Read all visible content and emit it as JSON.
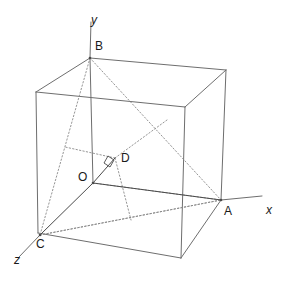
{
  "figure": {
    "width": 287,
    "height": 281,
    "background": "#ffffff",
    "stroke_solid": "#6e6e6e",
    "stroke_dotted": "#8a8a8a",
    "stroke_accent": "#4a4a4a",
    "label_color": "#1a1a1a"
  },
  "axes": [
    {
      "id": "x",
      "label": "x",
      "label_x": 266,
      "label_y": 204,
      "from": [
        221,
        200
      ],
      "to": [
        262,
        196
      ]
    },
    {
      "id": "y",
      "label": "y",
      "label_x": 91,
      "label_y": 14,
      "from": [
        90,
        58
      ],
      "to": [
        91,
        22
      ]
    },
    {
      "id": "z",
      "label": "z",
      "label_x": 14,
      "label_y": 254,
      "from": [
        40,
        235
      ],
      "to": [
        19,
        257
      ]
    }
  ],
  "points": [
    {
      "id": "A",
      "label": "A",
      "x": 221,
      "y": 200,
      "label_x": 224,
      "label_y": 205
    },
    {
      "id": "B",
      "label": "B",
      "x": 90,
      "y": 58,
      "label_x": 95,
      "label_y": 40
    },
    {
      "id": "C",
      "label": "C",
      "x": 40,
      "y": 235,
      "label_x": 36,
      "label_y": 238
    },
    {
      "id": "D",
      "label": "D",
      "x": 115,
      "y": 158,
      "label_x": 121,
      "label_y": 152
    },
    {
      "id": "O",
      "label": "O",
      "x": 93,
      "y": 183,
      "label_x": 78,
      "label_y": 171
    }
  ],
  "cube_vertices": {
    "back_top_left": [
      36,
      92
    ],
    "back_top_right": [
      226,
      70
    ],
    "front_top_left": [
      90,
      58
    ],
    "front_top_right": [
      185,
      107
    ],
    "back_bottom_left": [
      38,
      233
    ],
    "back_bottom_right": [
      226,
      70
    ],
    "front_bottom_left": [
      40,
      235
    ],
    "front_bottom_right": [
      181,
      258
    ]
  },
  "edges_solid": [
    {
      "name": "top-back-left",
      "from": [
        36,
        92
      ],
      "to": [
        90,
        58
      ]
    },
    {
      "name": "top-front-top",
      "from": [
        90,
        58
      ],
      "to": [
        226,
        70
      ]
    },
    {
      "name": "top-back-right",
      "from": [
        36,
        92
      ],
      "to": [
        185,
        107
      ]
    },
    {
      "name": "top-right-front",
      "from": [
        185,
        107
      ],
      "to": [
        226,
        70
      ]
    },
    {
      "name": "vertical-left",
      "from": [
        36,
        92
      ],
      "to": [
        38,
        233
      ]
    },
    {
      "name": "vertical-mid",
      "from": [
        185,
        107
      ],
      "to": [
        181,
        258
      ]
    },
    {
      "name": "vertical-right",
      "from": [
        226,
        70
      ],
      "to": [
        221,
        200
      ]
    },
    {
      "name": "bottom-left",
      "from": [
        38,
        233
      ],
      "to": [
        181,
        258
      ]
    },
    {
      "name": "bottom-right",
      "from": [
        181,
        258
      ],
      "to": [
        221,
        200
      ]
    },
    {
      "name": "vertical-B",
      "from": [
        90,
        58
      ],
      "to": [
        93,
        183
      ]
    }
  ],
  "edges_dotted": [
    {
      "name": "hidden-back-bottom-horizontal",
      "from": [
        40,
        235
      ],
      "to": [
        221,
        200
      ]
    },
    {
      "name": "hidden-back-vertical",
      "from": [
        93,
        183
      ],
      "to": [
        221,
        200
      ]
    }
  ],
  "triangle_dotted": [
    {
      "name": "BA",
      "from": [
        90,
        58
      ],
      "to": [
        221,
        200
      ]
    },
    {
      "name": "BC",
      "from": [
        90,
        58
      ],
      "to": [
        40,
        235
      ]
    },
    {
      "name": "CA",
      "from": [
        40,
        235
      ],
      "to": [
        221,
        200
      ]
    }
  ],
  "construction_dotted": [
    {
      "name": "D-to-BA-midpoint",
      "from": [
        115,
        158
      ],
      "to": [
        167,
        120
      ]
    },
    {
      "name": "D-to-BC-foot",
      "from": [
        115,
        158
      ],
      "to": [
        65,
        147
      ]
    },
    {
      "name": "D-to-CA-foot",
      "from": [
        115,
        158
      ],
      "to": [
        131,
        220
      ]
    }
  ],
  "segments_solid_accent": [
    {
      "name": "OD-perpendicular",
      "from": [
        93,
        183
      ],
      "to": [
        115,
        158
      ]
    },
    {
      "name": "OC",
      "from": [
        93,
        183
      ],
      "to": [
        40,
        235
      ]
    },
    {
      "name": "OA",
      "from": [
        93,
        183
      ],
      "to": [
        221,
        200
      ]
    }
  ],
  "right_angle_mark": {
    "name": "right-angle-at-D",
    "points": "104,163 108,156 114,160 110,167"
  }
}
